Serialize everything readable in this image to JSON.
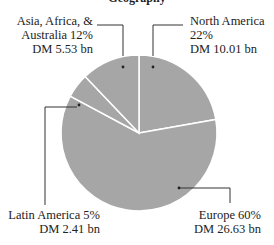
{
  "chart_data": {
    "type": "pie",
    "title": "Geography",
    "start_angle": "12 o'clock, clockwise",
    "slice_color": "#a6a6a6",
    "separator_color": "#ffffff",
    "slices": [
      {
        "label": "North America",
        "percent": 22,
        "value_text": "DM 10.01 bn",
        "value": 10.01
      },
      {
        "label": "Europe",
        "percent": 60,
        "value_text": "DM 26.63 bn",
        "value": 26.63
      },
      {
        "label": "Latin America",
        "percent": 5,
        "value_text": "DM 2.41 bn",
        "value": 2.41
      },
      {
        "label": "Asia, Africa, & Australia",
        "percent": 12,
        "value_text": "DM 5.53 bn",
        "value": 5.53
      }
    ]
  },
  "labels": {
    "na_line1": "North America",
    "na_line2": "22%",
    "na_line3": "DM 10.01 bn",
    "asia_line1": "Asia, Africa, &",
    "asia_line2": "Australia  12%",
    "asia_line3": "DM 5.53 bn",
    "latam_line1": "Latin America  5%",
    "latam_line2": "DM 2.41 bn",
    "europe_line1": "Europe  60%",
    "europe_line2": "DM 26.63 bn"
  }
}
